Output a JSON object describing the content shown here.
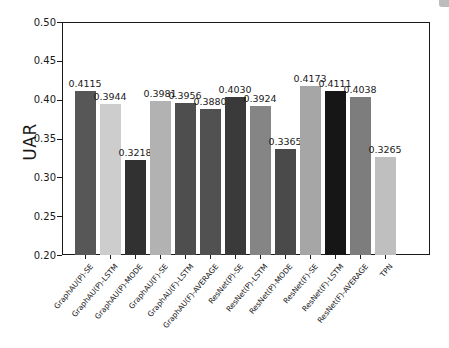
{
  "chart_data": {
    "type": "bar",
    "title": "",
    "xlabel": "",
    "ylabel": "UAR",
    "ylim": [
      0.2,
      0.5
    ],
    "yticks": [
      0.2,
      0.25,
      0.3,
      0.35,
      0.4,
      0.45,
      0.5
    ],
    "grid": false,
    "legend_position": "none",
    "categories": [
      "GraphAU(P)-SE",
      "GraphAU(P)-LSTM",
      "GraphAU(P)-MODE",
      "GraphAU(F)-SE",
      "GraphAU(F)-LSTM",
      "GraphAU(F)-AVERAGE",
      "ResNet(P)-SE",
      "ResNet(P)-LSTM",
      "ResNet(P)-MODE",
      "ResNet(F)-SE",
      "ResNet(F)-LSTM",
      "ResNet(F)-AVERAGE",
      "TPN"
    ],
    "values": [
      0.4115,
      0.3944,
      0.3218,
      0.3981,
      0.3956,
      0.388,
      0.403,
      0.3924,
      0.3365,
      0.4173,
      0.4111,
      0.4038,
      0.3265
    ],
    "value_labels": [
      "0.4115",
      "0.3944",
      "0.3218",
      "0.3981",
      "0.3956",
      "0.3880",
      "0.4030",
      "0.3924",
      "0.3365",
      "0.4173",
      "0.4111",
      "0.4038",
      "0.3265"
    ],
    "bar_colors": [
      "#575757",
      "#cdcdcd",
      "#313131",
      "#b2b2b2",
      "#4e4e4e",
      "#515151",
      "#3a3a3a",
      "#858585",
      "#4a4a4a",
      "#a6a6a6",
      "#161616",
      "#7d7d7d",
      "#bfbfbf"
    ],
    "axis_color": "#1a1a1a",
    "background_color": "#ffffff"
  }
}
